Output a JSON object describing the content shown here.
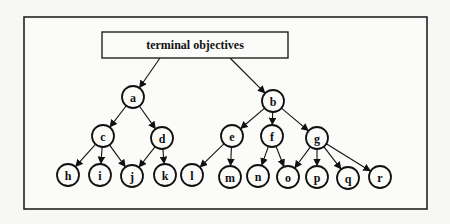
{
  "diagram": {
    "root": {
      "label": "terminal objectives",
      "box": [
        102,
        32,
        186,
        26
      ]
    },
    "frame": [
      24,
      17,
      403,
      192
    ],
    "nodes": [
      {
        "id": "a",
        "label": "a",
        "x": 133,
        "y": 97
      },
      {
        "id": "b",
        "label": "b",
        "x": 273,
        "y": 101
      },
      {
        "id": "c",
        "label": "c",
        "x": 103,
        "y": 136
      },
      {
        "id": "d",
        "label": "d",
        "x": 162,
        "y": 138
      },
      {
        "id": "e",
        "label": "e",
        "x": 232,
        "y": 136
      },
      {
        "id": "f",
        "label": "f",
        "x": 272,
        "y": 136
      },
      {
        "id": "g",
        "label": "g",
        "x": 317,
        "y": 138
      },
      {
        "id": "h",
        "label": "h",
        "x": 68,
        "y": 175
      },
      {
        "id": "i",
        "label": "i",
        "x": 100,
        "y": 175
      },
      {
        "id": "j",
        "label": "j",
        "x": 132,
        "y": 176
      },
      {
        "id": "k",
        "label": "k",
        "x": 165,
        "y": 175
      },
      {
        "id": "l",
        "label": "l",
        "x": 192,
        "y": 175
      },
      {
        "id": "m",
        "label": "m",
        "x": 230,
        "y": 177
      },
      {
        "id": "n",
        "label": "n",
        "x": 258,
        "y": 176
      },
      {
        "id": "o",
        "label": "o",
        "x": 288,
        "y": 177
      },
      {
        "id": "p",
        "label": "p",
        "x": 317,
        "y": 177
      },
      {
        "id": "q",
        "label": "q",
        "x": 348,
        "y": 178
      },
      {
        "id": "r",
        "label": "r",
        "x": 380,
        "y": 177
      }
    ],
    "edges": [
      [
        "root",
        "a"
      ],
      [
        "root",
        "b"
      ],
      [
        "a",
        "c"
      ],
      [
        "a",
        "d"
      ],
      [
        "b",
        "e"
      ],
      [
        "b",
        "f"
      ],
      [
        "b",
        "g"
      ],
      [
        "c",
        "h"
      ],
      [
        "c",
        "i"
      ],
      [
        "c",
        "j"
      ],
      [
        "d",
        "j"
      ],
      [
        "d",
        "k"
      ],
      [
        "e",
        "l"
      ],
      [
        "e",
        "m"
      ],
      [
        "f",
        "n"
      ],
      [
        "f",
        "o"
      ],
      [
        "g",
        "o"
      ],
      [
        "g",
        "p"
      ],
      [
        "g",
        "q"
      ],
      [
        "g",
        "r"
      ]
    ],
    "root_anchors": {
      "a": [
        160,
        58
      ],
      "b": [
        230,
        58
      ]
    },
    "node_radius": 11
  }
}
